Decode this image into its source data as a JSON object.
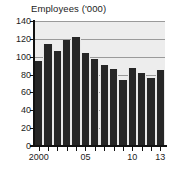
{
  "chart_data": {
    "type": "bar",
    "title": "Employees ('000)",
    "xlabel": "",
    "ylabel": "",
    "categories": [
      "2000",
      "2001",
      "2002",
      "2003",
      "2004",
      "2005",
      "2006",
      "2007",
      "2008",
      "2009",
      "2010",
      "2011",
      "2012",
      "2013"
    ],
    "values": [
      95,
      114,
      106,
      119,
      122,
      104,
      98,
      91,
      86,
      74,
      87,
      82,
      76,
      85
    ],
    "ylim": [
      0,
      140
    ],
    "yticks": [
      0,
      20,
      40,
      60,
      80,
      100,
      120,
      140
    ],
    "ytick_labels": [
      "0",
      "20",
      "40",
      "60",
      "80",
      "100",
      "120",
      "140"
    ],
    "xtick_labels": [
      "2000",
      "05",
      "10",
      "13"
    ],
    "xtick_categories": [
      "2000",
      "2005",
      "2010",
      "2013"
    ],
    "grid": true,
    "legend": false,
    "series_color": "#262626",
    "plot_background": "#ededed",
    "gridline_color": "#9a9a9a",
    "axis_color": "#111111"
  }
}
